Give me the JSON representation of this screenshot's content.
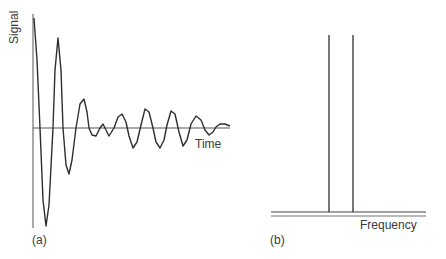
{
  "panel_a": {
    "tag": "(a)",
    "y_label": "Signal",
    "x_label": "Time",
    "signal_points": [
      [
        34,
        18
      ],
      [
        37,
        60
      ],
      [
        40,
        128
      ],
      [
        43,
        200
      ],
      [
        46,
        226
      ],
      [
        49,
        205
      ],
      [
        53,
        128
      ],
      [
        55,
        70
      ],
      [
        58,
        38
      ],
      [
        61,
        70
      ],
      [
        63,
        128
      ],
      [
        66,
        165
      ],
      [
        69,
        174
      ],
      [
        72,
        160
      ],
      [
        76,
        128
      ],
      [
        80,
        104
      ],
      [
        84,
        99
      ],
      [
        87,
        112
      ],
      [
        89,
        128
      ],
      [
        92,
        135
      ],
      [
        96,
        136
      ],
      [
        100,
        128
      ],
      [
        103,
        124
      ],
      [
        106,
        130
      ],
      [
        109,
        136
      ],
      [
        114,
        128
      ],
      [
        118,
        117
      ],
      [
        122,
        114
      ],
      [
        126,
        122
      ],
      [
        129,
        136
      ],
      [
        133,
        148
      ],
      [
        137,
        142
      ],
      [
        141,
        125
      ],
      [
        145,
        109
      ],
      [
        149,
        112
      ],
      [
        153,
        128
      ],
      [
        156,
        142
      ],
      [
        160,
        148
      ],
      [
        164,
        140
      ],
      [
        167,
        125
      ],
      [
        171,
        111
      ],
      [
        175,
        114
      ],
      [
        179,
        132
      ],
      [
        183,
        146
      ],
      [
        187,
        140
      ],
      [
        191,
        124
      ],
      [
        196,
        116
      ],
      [
        201,
        120
      ],
      [
        205,
        130
      ],
      [
        209,
        135
      ],
      [
        213,
        132
      ],
      [
        216,
        127
      ],
      [
        220,
        124
      ],
      [
        225,
        124
      ],
      [
        230,
        126
      ]
    ]
  },
  "panel_b": {
    "tag": "(b)",
    "x_label": "Frequency",
    "peaks_x": [
      329,
      353
    ],
    "peak_top_y": 35,
    "baseline_y": 212
  },
  "colors": {
    "stroke": "#2e2e2e",
    "axis": "#555555",
    "text": "#3a3a3a"
  }
}
